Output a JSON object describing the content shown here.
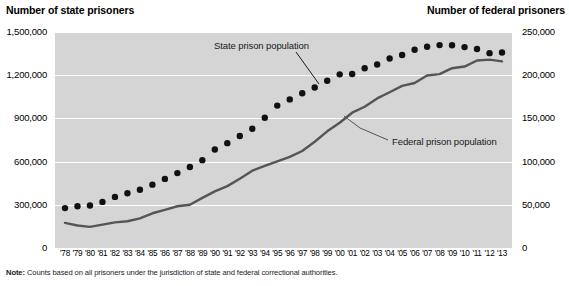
{
  "left_axis_title": "Number of state prisoners",
  "right_axis_title": "Number of federal prisoners",
  "annotations": {
    "state": "State prison population",
    "federal": "Federal prison population"
  },
  "note_label": "Note:",
  "note_text": " Counts based on all prisoners under the jurisdiction of state and federal correctional authorities.",
  "chart_data": {
    "type": "line",
    "title": "",
    "xlabel": "",
    "ylabel": "Number of state prisoners",
    "y2label": "Number of federal prisoners",
    "grid": true,
    "legend": "annotations on plot",
    "plot_background": "#d5d5d5",
    "gridline_color": "#ffffff",
    "series_colors": {
      "state": "#111111",
      "federal": "#555555"
    },
    "x": [
      "'78",
      "'79",
      "'80",
      "'81",
      "'82",
      "'83",
      "'84",
      "'85",
      "'86",
      "'87",
      "'88",
      "'89",
      "'90",
      "'91",
      "'92",
      "'93",
      "'94",
      "'95",
      "'96",
      "'97",
      "'98",
      "'99",
      "'00",
      "'01",
      "'02",
      "'03",
      "'04",
      "'05",
      "'06",
      "'07",
      "'08",
      "'09",
      "'10",
      "'11",
      "'12",
      "'13"
    ],
    "xtick_labels": [
      "'78",
      "'79",
      "'80",
      "'81",
      "'82",
      "'83",
      "'84",
      "'85",
      "'86",
      "'87",
      "'88",
      "'89",
      "'90",
      "'91",
      "'92",
      "'93",
      "'94",
      "'95",
      "'96",
      "'97",
      "'98",
      "'99",
      "'00",
      "'01",
      "'02",
      "'03",
      "'04",
      "'05",
      "'06",
      "'07",
      "'08",
      "'09",
      "'10",
      "'11",
      "'12",
      "'13"
    ],
    "ylim": [
      0,
      1500000
    ],
    "yticks": [
      0,
      300000,
      600000,
      900000,
      1200000,
      1500000
    ],
    "ytick_labels": [
      "0",
      "300,000",
      "600,000",
      "900,000",
      "1,200,000",
      "1,500,000"
    ],
    "y2lim": [
      0,
      250000
    ],
    "y2ticks": [
      0,
      50000,
      100000,
      150000,
      200000,
      250000
    ],
    "y2tick_labels": [
      "0",
      "50,000",
      "100,000",
      "150,000",
      "200,000",
      "250,000"
    ],
    "series": [
      {
        "name": "State prison population",
        "axis": "left",
        "style": "dotted-markers",
        "values": [
          277000,
          290000,
          295000,
          320000,
          355000,
          380000,
          404000,
          440000,
          480000,
          520000,
          562000,
          610000,
          684000,
          728000,
          778000,
          828000,
          904000,
          989000,
          1032000,
          1075000,
          1115000,
          1161000,
          1206000,
          1208000,
          1248000,
          1274000,
          1316000,
          1340000,
          1377000,
          1398000,
          1409000,
          1408000,
          1395000,
          1382000,
          1353000,
          1358000
        ]
      },
      {
        "name": "Federal prison population",
        "axis": "right",
        "style": "solid-line",
        "values": [
          29000,
          26000,
          24500,
          27000,
          29700,
          31000,
          34300,
          40200,
          44100,
          48300,
          50000,
          58000,
          65500,
          71600,
          80200,
          89500,
          95000,
          100200,
          105500,
          112300,
          123000,
          135000,
          145000,
          156600,
          163500,
          173100,
          180300,
          187600,
          191000,
          199600,
          201300,
          208100,
          210000,
          217000,
          218000,
          216000
        ]
      }
    ]
  }
}
